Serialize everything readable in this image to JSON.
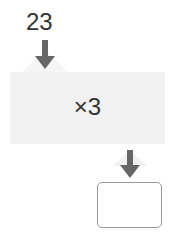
{
  "diagram": {
    "input_value": "23",
    "operation": "×3",
    "result_value": "",
    "colors": {
      "box_fill": "#f2f2f2",
      "arrow": "#666666",
      "result_border": "#999999",
      "text": "#333333"
    }
  }
}
